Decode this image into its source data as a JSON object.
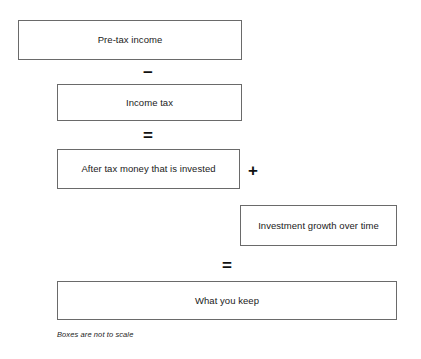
{
  "diagram": {
    "boxes": [
      {
        "id": "pre-tax-income",
        "label": "Pre-tax income"
      },
      {
        "id": "income-tax",
        "label": "Income tax"
      },
      {
        "id": "after-tax-invested",
        "label": "After tax money that is invested"
      },
      {
        "id": "investment-growth",
        "label": "Investment growth over time"
      },
      {
        "id": "what-you-keep",
        "label": "What you keep"
      }
    ],
    "operators": [
      {
        "id": "minus-1",
        "symbol": "−"
      },
      {
        "id": "equals-1",
        "symbol": "="
      },
      {
        "id": "plus-1",
        "symbol": "+"
      },
      {
        "id": "equals-2",
        "symbol": "="
      }
    ],
    "footnote": "Boxes are not to scale",
    "colors": {
      "background": "#ffffff",
      "box_border": "#6a6a6a",
      "text": "#1a1a1a",
      "operator": "#111111"
    }
  }
}
